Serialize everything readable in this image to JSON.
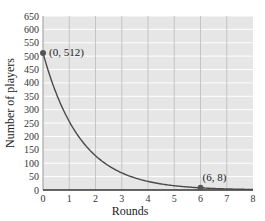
{
  "chart_data": {
    "type": "line",
    "title": "",
    "xlabel": "Rounds",
    "ylabel": "Number of players",
    "xlim": [
      0,
      8
    ],
    "ylim": [
      0,
      650
    ],
    "x_ticks": [
      0,
      1,
      2,
      3,
      4,
      5,
      6,
      7,
      8
    ],
    "y_ticks": [
      0,
      50,
      100,
      150,
      200,
      250,
      300,
      350,
      400,
      450,
      500,
      550,
      600,
      650
    ],
    "grid": true,
    "legend": null,
    "series": [
      {
        "name": "Number of players",
        "function": "y = 512 * (1/2)^x",
        "x": [
          0,
          0.5,
          1,
          1.5,
          2,
          2.5,
          3,
          3.5,
          4,
          4.5,
          5,
          5.5,
          6,
          6.5,
          7,
          7.5,
          8
        ],
        "values": [
          512,
          362,
          256,
          181,
          128,
          90.5,
          64,
          45.3,
          32,
          22.6,
          16,
          11.3,
          8,
          5.7,
          4,
          2.8,
          2
        ]
      }
    ],
    "annotations": [
      {
        "x": 0,
        "y": 512,
        "label": "(0, 512)"
      },
      {
        "x": 6,
        "y": 8,
        "label": "(6, 8)"
      }
    ],
    "colors": {
      "plot_background": "#e6e6e6",
      "grid": "#ffffff",
      "curve": "#4a4a4a",
      "axis": "#333333",
      "point": "#555555"
    }
  }
}
